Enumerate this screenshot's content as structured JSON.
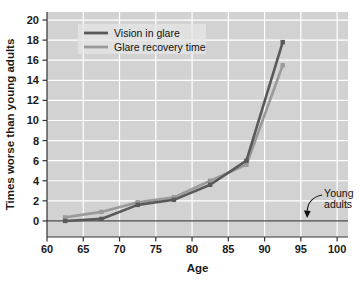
{
  "chart_data": {
    "type": "line",
    "title": "",
    "xlabel": "Age",
    "ylabel": "Times worse than young adults",
    "xlim": [
      60,
      101.5
    ],
    "ylim": [
      -1.6,
      20.8
    ],
    "xticks": [
      60,
      65,
      70,
      75,
      80,
      85,
      90,
      95,
      100
    ],
    "yticks": [
      0,
      2,
      4,
      6,
      8,
      10,
      12,
      14,
      16,
      18,
      20
    ],
    "xtick_labels": [
      "60",
      "65",
      "70",
      "75",
      "80",
      "85",
      "90",
      "95",
      "100"
    ],
    "ytick_labels": [
      "0",
      "2",
      "4",
      "6",
      "8",
      "10",
      "12",
      "14",
      "16",
      "18",
      "20"
    ],
    "grid": true,
    "grid_color": "#ffffff",
    "plot_background": "#d2d2d2",
    "legend_position": "upper-left-inside",
    "x": [
      62.5,
      67.5,
      72.5,
      77.5,
      82.5,
      87.5,
      92.5
    ],
    "series": [
      {
        "name": "Vision in glare",
        "color": "#595959",
        "values": [
          0.0,
          0.2,
          1.6,
          2.1,
          3.6,
          6.0,
          17.8
        ]
      },
      {
        "name": "Glare recovery time",
        "color": "#9a9a9a",
        "values": [
          0.35,
          0.9,
          1.85,
          2.35,
          4.0,
          5.6,
          15.5
        ]
      }
    ],
    "reference_line": {
      "y": 0,
      "color": "#4d4d4d",
      "label": "Young adults"
    },
    "annotations": [
      {
        "text_line1": "Young",
        "text_line2": "adults",
        "points_to_y": 0,
        "points_to_x": 96
      }
    ]
  },
  "legend": {
    "entries": [
      {
        "label": "Vision in glare",
        "color": "#595959"
      },
      {
        "label": "Glare recovery time",
        "color": "#9a9a9a"
      }
    ]
  },
  "axes": {
    "x_title": "Age",
    "y_title": "Times worse than young adults"
  }
}
